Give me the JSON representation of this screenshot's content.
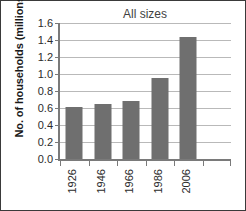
{
  "chart_data": {
    "type": "bar",
    "title": "All sizes",
    "xlabel": "",
    "ylabel": "No. of households (millions)",
    "categories": [
      "1926",
      "1946",
      "1966",
      "1986",
      "2006"
    ],
    "values": [
      0.61,
      0.65,
      0.68,
      0.95,
      1.44
    ],
    "series": [
      {
        "name": "All sizes",
        "values": [
          0.61,
          0.65,
          0.68,
          0.95,
          1.44
        ]
      }
    ],
    "ylim": [
      0.0,
      1.6
    ],
    "ytick_labels": [
      "1.6",
      "1.4",
      "1.2",
      "1.0",
      "0.8",
      "0.6",
      "0.4",
      "0.2",
      "0.0"
    ],
    "ytick_values": [
      1.6,
      1.4,
      1.2,
      1.0,
      0.8,
      0.6,
      0.4,
      0.2,
      0.0
    ],
    "ytick_step": 0.2,
    "grid": true,
    "grid_axis": "y",
    "legend": false,
    "legend_position": "none",
    "bar_color": "#6f6f6f",
    "gridline_color": "#b9b9b9",
    "axis_color": "#7a7a7a",
    "text_color": "#2b2b2b",
    "background_color": "#ffffff",
    "border_color": "#3a3a3a",
    "xtick_label_rotation": -90,
    "empty_trailing_slot": true
  }
}
